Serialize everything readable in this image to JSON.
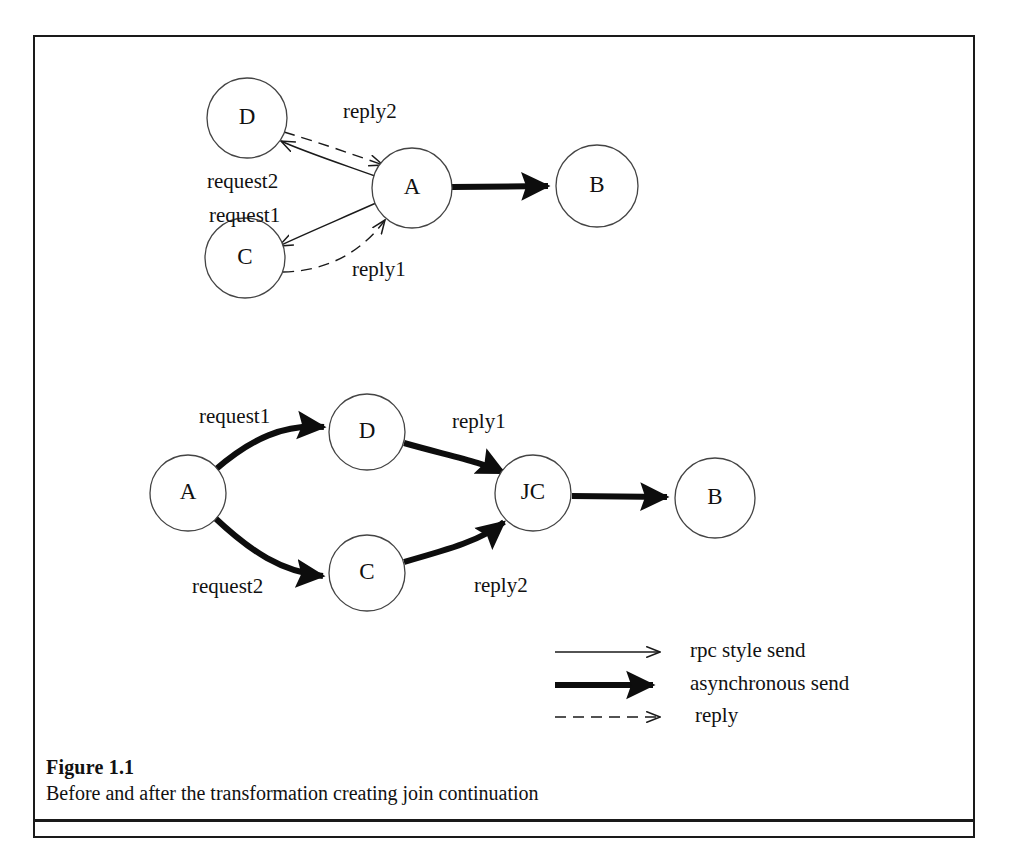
{
  "figure": {
    "caption_title": "Figure 1.1",
    "caption_text": "Before and after the transformation creating join continuation"
  },
  "diagram_before": {
    "name": "before-transformation",
    "nodes": [
      {
        "id": "D",
        "label": "D",
        "cx": 247,
        "cy": 118,
        "r": 40
      },
      {
        "id": "A",
        "label": "A",
        "cx": 412,
        "cy": 188,
        "r": 40
      },
      {
        "id": "C",
        "label": "C",
        "cx": 245,
        "cy": 258,
        "r": 40
      },
      {
        "id": "B",
        "label": "B",
        "cx": 597,
        "cy": 186,
        "r": 41
      }
    ],
    "edges": [
      {
        "from": "A",
        "to": "D",
        "label": "request2",
        "style": "rpc-style-send"
      },
      {
        "from": "A",
        "to": "C",
        "label": "request1",
        "style": "rpc-style-send"
      },
      {
        "from": "D",
        "to": "A",
        "label": "reply2",
        "style": "reply"
      },
      {
        "from": "C",
        "to": "A",
        "label": "reply1",
        "style": "reply"
      },
      {
        "from": "A",
        "to": "B",
        "label": "",
        "style": "asynchronous-send"
      }
    ],
    "labels": [
      {
        "text": "reply2",
        "x": 343,
        "y": 118
      },
      {
        "text": "request2",
        "x": 207,
        "y": 188
      },
      {
        "text": "request1",
        "x": 209,
        "y": 222
      },
      {
        "text": "reply1",
        "x": 352,
        "y": 276
      }
    ]
  },
  "diagram_after": {
    "name": "after-transformation",
    "nodes": [
      {
        "id": "A",
        "label": "A",
        "cx": 188,
        "cy": 493,
        "r": 38
      },
      {
        "id": "D",
        "label": "D",
        "cx": 367,
        "cy": 432,
        "r": 38
      },
      {
        "id": "C",
        "label": "C",
        "cx": 367,
        "cy": 573,
        "r": 38
      },
      {
        "id": "JC",
        "label": "JC",
        "cx": 533,
        "cy": 493,
        "r": 38
      },
      {
        "id": "B",
        "label": "B",
        "cx": 715,
        "cy": 498,
        "r": 40
      }
    ],
    "edges": [
      {
        "from": "A",
        "to": "D",
        "label": "request1",
        "style": "asynchronous-send"
      },
      {
        "from": "A",
        "to": "C",
        "label": "request2",
        "style": "asynchronous-send"
      },
      {
        "from": "D",
        "to": "JC",
        "label": "reply1",
        "style": "asynchronous-send"
      },
      {
        "from": "C",
        "to": "JC",
        "label": "reply2",
        "style": "asynchronous-send"
      },
      {
        "from": "JC",
        "to": "B",
        "label": "",
        "style": "asynchronous-send"
      }
    ],
    "labels": [
      {
        "text": "request1",
        "x": 199,
        "y": 423
      },
      {
        "text": "reply1",
        "x": 452,
        "y": 428
      },
      {
        "text": "request2",
        "x": 192,
        "y": 593
      },
      {
        "text": "reply2",
        "x": 474,
        "y": 592
      }
    ]
  },
  "legend": {
    "items": [
      {
        "label": "rpc style send",
        "style": "thin",
        "y": 652
      },
      {
        "label": "asynchronous send",
        "style": "thick",
        "y": 685
      },
      {
        "label": "reply",
        "style": "dashed",
        "y": 717
      }
    ],
    "line_x_start": 555,
    "line_x_end": 665,
    "text_x": 690
  },
  "colors": {
    "ink": "#111111",
    "frame": "#1a1a1a",
    "node_stroke": "#444444",
    "background": "#ffffff"
  }
}
